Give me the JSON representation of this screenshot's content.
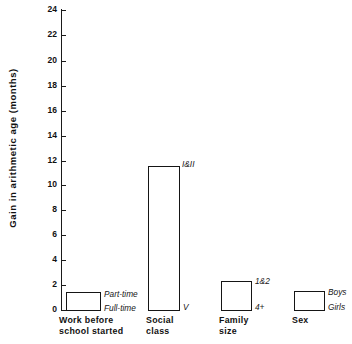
{
  "chart_data": {
    "type": "bar",
    "title": "",
    "subtitle": "",
    "xlabel": "",
    "ylabel": "Gain in arithmetic age (months)",
    "ylim": [
      0,
      24
    ],
    "ytick_step": 2,
    "yticks": [
      "0",
      "2",
      "4",
      "6",
      "8",
      "10",
      "12",
      "14",
      "16",
      "18",
      "20",
      "22",
      "24"
    ],
    "grid": false,
    "legend": "none",
    "categories": [
      "Work before\nschool started",
      "Social\nclass",
      "Family\nsize",
      "Sex"
    ],
    "values": [
      1.7,
      11.7,
      2.9,
      1.9
    ],
    "annotations": [
      {
        "bar": 0,
        "top_label": "Part-time",
        "bottom_label": "Full-time"
      },
      {
        "bar": 1,
        "top_label": "I&II",
        "bottom_label": "V"
      },
      {
        "bar": 2,
        "top_label": "1&2",
        "bottom_label": "4+"
      },
      {
        "bar": 3,
        "top_label": "Boys",
        "bottom_label": "Girls"
      }
    ]
  },
  "axis": {
    "y_title": "Gain in arithmetic age (months)",
    "ticks": [
      {
        "value": "0",
        "y": 310
      },
      {
        "value": "2",
        "y": 285
      },
      {
        "value": "4",
        "y": 260
      },
      {
        "value": "6",
        "y": 235
      },
      {
        "value": "8",
        "y": 210
      },
      {
        "value": "10",
        "y": 185
      },
      {
        "value": "12",
        "y": 161
      },
      {
        "value": "14",
        "y": 136
      },
      {
        "value": "16",
        "y": 111
      },
      {
        "value": "18",
        "y": 86
      },
      {
        "value": "20",
        "y": 61
      },
      {
        "value": "22",
        "y": 35
      },
      {
        "value": "24",
        "y": 10
      }
    ]
  },
  "bars": [
    {
      "name": "work-before-school-started",
      "left": 66,
      "width": 35,
      "top": 292,
      "height": 19,
      "top_label": "Part-time",
      "top_label_x": 104,
      "top_label_y": 290,
      "bottom_label": "Full-time",
      "bottom_label_x": 104,
      "bottom_label_y": 304,
      "cat_line1": "Work before",
      "cat_line2": "school started",
      "cat_x": 59,
      "cat_y": 315
    },
    {
      "name": "social-class",
      "left": 148,
      "width": 32,
      "top": 166,
      "height": 145,
      "top_label": "I&II",
      "top_label_x": 182,
      "top_label_y": 160,
      "bottom_label": "V",
      "bottom_label_x": 183,
      "bottom_label_y": 303,
      "cat_line1": "Social",
      "cat_line2": "class",
      "cat_x": 146,
      "cat_y": 315
    },
    {
      "name": "family-size",
      "left": 221,
      "width": 31,
      "top": 281,
      "height": 30,
      "top_label": "1&2",
      "top_label_x": 255,
      "top_label_y": 277,
      "bottom_label": "4+",
      "bottom_label_x": 255,
      "bottom_label_y": 303,
      "cat_line1": "Family",
      "cat_line2": "size",
      "cat_x": 219,
      "cat_y": 315
    },
    {
      "name": "sex",
      "left": 294,
      "width": 31,
      "top": 291,
      "height": 20,
      "top_label": "Boys",
      "top_label_x": 328,
      "top_label_y": 288,
      "bottom_label": "Girls",
      "bottom_label_x": 328,
      "bottom_label_y": 303,
      "cat_line1": "Sex",
      "cat_line2": "",
      "cat_x": 292,
      "cat_y": 315
    }
  ]
}
